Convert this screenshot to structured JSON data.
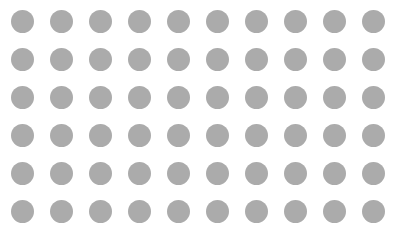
{
  "grid": {
    "rows": 6,
    "cols": 10,
    "dot_color": "#ababab",
    "background": "#ffffff",
    "dot_diameter": 23,
    "col_centers": [
      22,
      61,
      100,
      139,
      178,
      217,
      256,
      295,
      334,
      373
    ],
    "row_centers": [
      21,
      59,
      97,
      135,
      173,
      211
    ]
  }
}
